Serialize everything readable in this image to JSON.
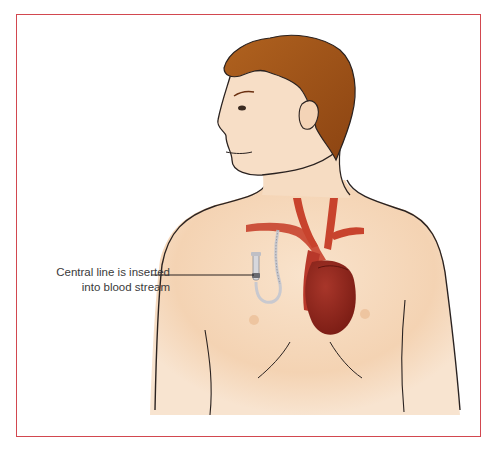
{
  "diagram": {
    "callout": {
      "line1": "Central line is inserted",
      "line2": "into blood stream"
    },
    "colors": {
      "frame": "#d2474f",
      "skin": "#f6d9bd",
      "skin_shadow": "#efc9a4",
      "hair": "#a8581c",
      "hair_dark": "#8c4412",
      "heart": "#8f2419",
      "vessels": "#c8432d",
      "catheter": "#c9c9cf",
      "outline": "#2a2220"
    },
    "elements": [
      "head",
      "hair",
      "ear",
      "torso",
      "vessels",
      "heart",
      "catheter",
      "nipples",
      "ribcage-lines"
    ]
  }
}
